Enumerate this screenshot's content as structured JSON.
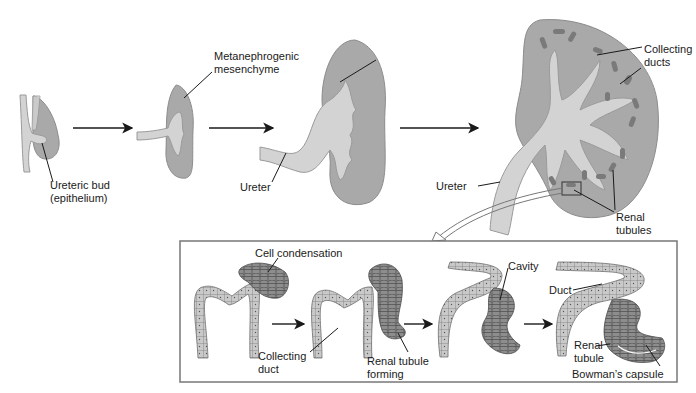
{
  "diagram": {
    "stages_top": [
      {
        "id": "stage-1",
        "labels": [
          "Ureteric bud",
          "(epithelium)"
        ]
      },
      {
        "id": "stage-2",
        "labels": [
          "Metanephrogenic",
          "mesenchyme"
        ]
      },
      {
        "id": "stage-3",
        "labels": [
          "Ureter"
        ]
      },
      {
        "id": "stage-4",
        "labels": [
          "Collecting",
          "ducts",
          "Ureter",
          "Renal",
          "tubules"
        ]
      }
    ],
    "labels": {
      "ureteric_bud_1": "Ureteric bud",
      "ureteric_bud_2": "(epithelium)",
      "metaneph_1": "Metanephrogenic",
      "metaneph_2": "mesenchyme",
      "ureter_stage3": "Ureter",
      "collecting_ducts_1": "Collecting",
      "collecting_ducts_2": "ducts",
      "ureter_stage4": "Ureter",
      "renal_tubules_1": "Renal",
      "renal_tubules_2": "tubules"
    },
    "inset": {
      "labels": {
        "cell_condensation": "Cell condensation",
        "collecting_duct_1": "Collecting",
        "collecting_duct_2": "duct",
        "renal_tubule_forming_1": "Renal tubule",
        "renal_tubule_forming_2": "forming",
        "cavity": "Cavity",
        "duct": "Duct",
        "renal_tubule_1": "Renal",
        "renal_tubule_2": "tubule",
        "bowmans_capsule": "Bowman’s capsule"
      }
    },
    "colors": {
      "mesenchyme": "#a9a9a9",
      "epithelium": "#d3d3d3",
      "tubule": "#7a7a7a",
      "line": "#1a1a1a"
    }
  }
}
